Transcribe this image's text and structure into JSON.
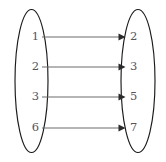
{
  "diagram": {
    "type": "function-mapping-diagram",
    "domain_set": {
      "name": "left-set",
      "elements": [
        "1",
        "2",
        "3",
        "6"
      ]
    },
    "codomain_set": {
      "name": "right-set",
      "elements": [
        "2",
        "3",
        "5",
        "7"
      ]
    },
    "mappings": [
      {
        "from": "1",
        "to": "2"
      },
      {
        "from": "2",
        "to": "3"
      },
      {
        "from": "3",
        "to": "5"
      },
      {
        "from": "6",
        "to": "7"
      }
    ],
    "colors": {
      "background": "#ffffff",
      "ellipse_stroke": "#1a1a1a",
      "arrow_line": "#6b6b6b",
      "arrow_head": "#2b2b2b",
      "label_text": "#555555"
    }
  }
}
